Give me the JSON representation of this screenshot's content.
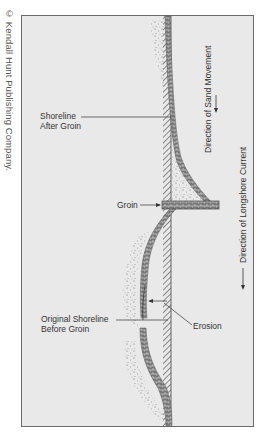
{
  "credit": "© Kendall Hunt Publishing Company.",
  "diagram": {
    "labels": {
      "shoreline_after_line1": "Shoreline",
      "shoreline_after_line2": "After Groin",
      "groin": "Groin",
      "original_line1": "Original Shoreline",
      "original_line2": "Before Groin",
      "erosion": "Erosion",
      "sand_movement": "Direction of Sand Movement",
      "longshore_current": "Direction of Longshore Current"
    },
    "colors": {
      "background": "#e9e9e9",
      "frame": "#6a6a6a",
      "ink": "#333333"
    }
  }
}
